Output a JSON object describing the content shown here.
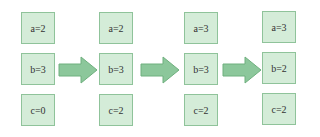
{
  "diagram": {
    "colors": {
      "box_fill": "#d4ecd8",
      "box_border": "#8fc39a",
      "arrow_fill": "#8cc79b",
      "arrow_stroke": "#6fb07e",
      "text": "#333333"
    },
    "states": [
      {
        "a": "a=2",
        "b": "b=3",
        "c": "c=0"
      },
      {
        "a": "a=2",
        "b": "b=3",
        "c": "c=2"
      },
      {
        "a": "a=3",
        "b": "b=3",
        "c": "c=2"
      },
      {
        "a": "a=3",
        "b": "b=2",
        "c": "c=2"
      }
    ],
    "arrows": [
      {
        "icon": "right-arrow-icon"
      },
      {
        "icon": "right-arrow-icon"
      },
      {
        "icon": "right-arrow-icon"
      }
    ]
  }
}
